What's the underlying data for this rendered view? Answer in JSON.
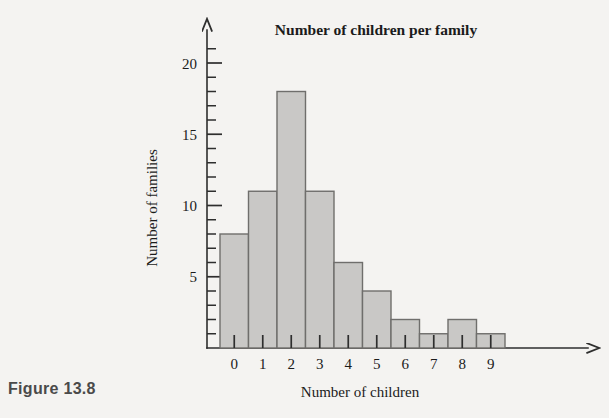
{
  "caption": "Figure 13.8",
  "chart_data": {
    "type": "bar",
    "title": "Number of children per family",
    "xlabel": "Number of children",
    "ylabel": "Number of families",
    "categories": [
      "0",
      "1",
      "2",
      "3",
      "4",
      "5",
      "6",
      "7",
      "8",
      "9"
    ],
    "values": [
      8,
      11,
      18,
      11,
      6,
      4,
      2,
      1,
      2,
      1
    ],
    "ylim": [
      0,
      21
    ],
    "xlim": [
      0,
      10
    ],
    "y_major_ticks": [
      5,
      10,
      15,
      20
    ],
    "y_major_tick_labels": [
      "5",
      "10",
      "15",
      "20"
    ],
    "y_minor_tick_step": 1,
    "grid": false,
    "legend": null,
    "bar_fill_color": "#c9c8c6",
    "bar_edge_color": "#6f6e6c",
    "axis_color": "#2e2e2e",
    "background_color": "#f4f3f1",
    "arrow_heads": [
      "x-axis-right",
      "y-axis-top"
    ]
  }
}
